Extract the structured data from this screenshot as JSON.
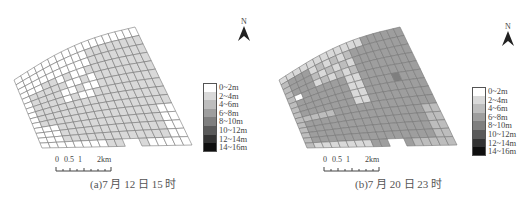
{
  "figure": {
    "panels": [
      {
        "id": "a",
        "caption": "(a)7 月 12 日 15 时",
        "north_label": "N",
        "scale": {
          "ticks": [
            "0",
            "0.5",
            "1",
            "2km"
          ]
        },
        "dominant_class": "2~4m",
        "description": "Most cells 0~2m (white) along the western and northern edges and in interior patches; eastern and central cells 2~4m (light grey)."
      },
      {
        "id": "b",
        "caption": "(b)7 月 20 日 23 时",
        "north_label": "N",
        "scale": {
          "ticks": [
            "0",
            "0.5",
            "1",
            "2km"
          ]
        },
        "dominant_class": "6~8m",
        "description": "Most cells 6~8m; north-west and southern edges 2~6m; one 0~2m cell at far west; one 8~10m cell in the north-east interior."
      }
    ],
    "legend": [
      {
        "label": "0~2m",
        "color": "#ffffff"
      },
      {
        "label": "2~4m",
        "color": "#d9d9d9"
      },
      {
        "label": "4~6m",
        "color": "#bdbdbd"
      },
      {
        "label": "6~8m",
        "color": "#9e9e9e"
      },
      {
        "label": "8~10m",
        "color": "#7f7f7f"
      },
      {
        "label": "10~12m",
        "color": "#5a5a5a"
      },
      {
        "label": "12~14m",
        "color": "#333333"
      },
      {
        "label": "14~16m",
        "color": "#0f0f0f"
      }
    ],
    "grid_line_color": "#777777"
  }
}
